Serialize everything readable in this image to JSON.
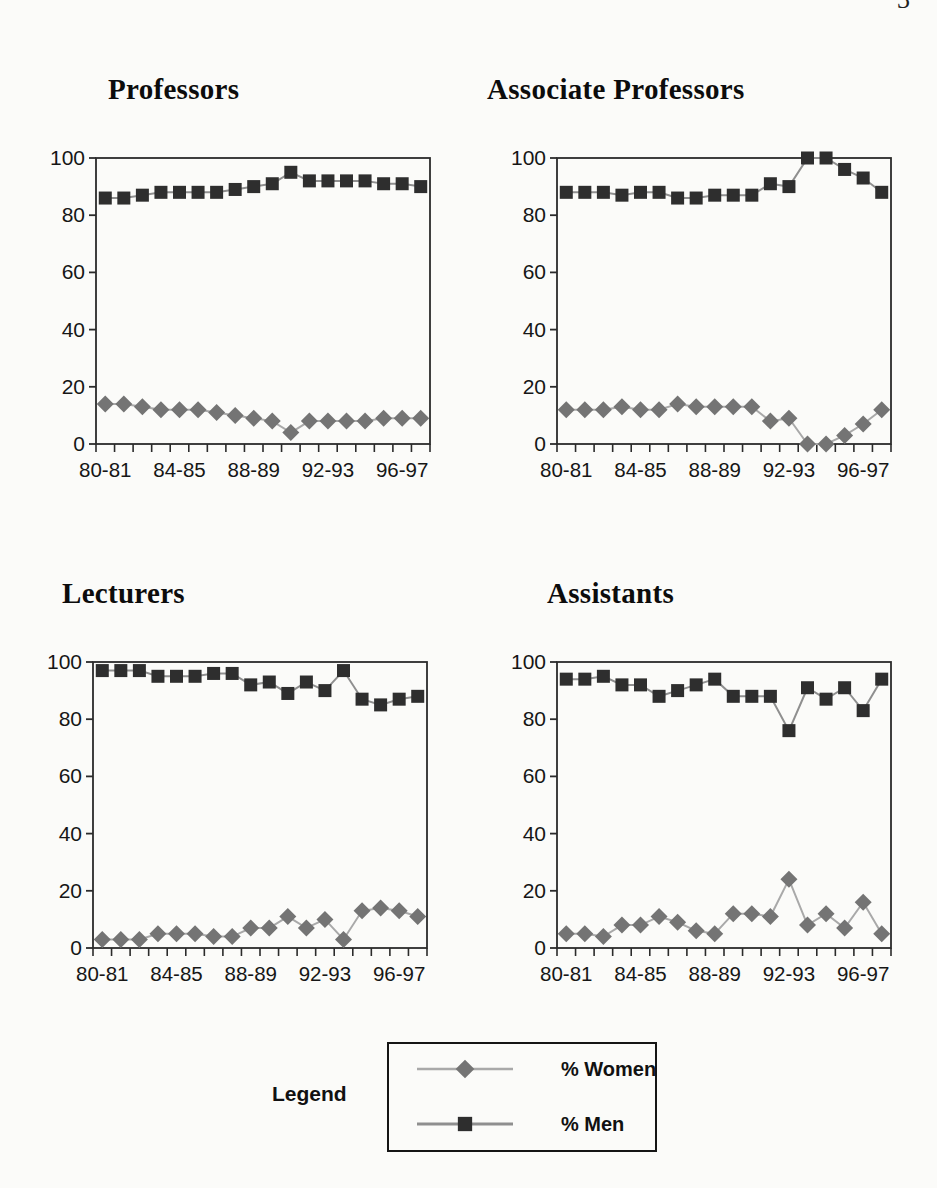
{
  "page": {
    "number_partial": "3"
  },
  "colors": {
    "women_marker": "#747474",
    "women_line": "#a9a9a9",
    "men_marker": "#2e2e2e",
    "men_line": "#8f8f8f",
    "axis": "#2b2b2b",
    "label_text": "#161616"
  },
  "y_axis": {
    "min": 0,
    "max": 100,
    "ticks": [
      0,
      20,
      40,
      60,
      80,
      100
    ]
  },
  "x_axis": {
    "tick_labels": [
      "80-81",
      "84-85",
      "88-89",
      "92-93",
      "96-97"
    ],
    "label_indices": [
      0,
      4,
      8,
      12,
      16
    ]
  },
  "legend": {
    "title": "Legend",
    "items": [
      {
        "label": "% Women",
        "marker": "diamond"
      },
      {
        "label": "% Men",
        "marker": "square"
      }
    ]
  },
  "chart_data": [
    {
      "type": "line",
      "title": "Professors",
      "categories": [
        "80-81",
        "81-82",
        "82-83",
        "83-84",
        "84-85",
        "85-86",
        "86-87",
        "87-88",
        "88-89",
        "89-90",
        "90-91",
        "91-92",
        "92-93",
        "93-94",
        "94-95",
        "95-96",
        "96-97",
        "97-98"
      ],
      "ylim": [
        0,
        100
      ],
      "grid": false,
      "series": [
        {
          "name": "% Women",
          "marker": "diamond",
          "values": [
            14,
            14,
            13,
            12,
            12,
            12,
            11,
            10,
            9,
            8,
            4,
            8,
            8,
            8,
            8,
            9,
            9,
            9
          ]
        },
        {
          "name": "% Men",
          "marker": "square",
          "values": [
            86,
            86,
            87,
            88,
            88,
            88,
            88,
            89,
            90,
            91,
            95,
            92,
            92,
            92,
            92,
            91,
            91,
            90
          ]
        }
      ]
    },
    {
      "type": "line",
      "title": "Associate Professors",
      "categories": [
        "80-81",
        "81-82",
        "82-83",
        "83-84",
        "84-85",
        "85-86",
        "86-87",
        "87-88",
        "88-89",
        "89-90",
        "90-91",
        "91-92",
        "92-93",
        "93-94",
        "94-95",
        "95-96",
        "96-97",
        "97-98"
      ],
      "ylim": [
        0,
        100
      ],
      "grid": false,
      "series": [
        {
          "name": "% Women",
          "marker": "diamond",
          "values": [
            12,
            12,
            12,
            13,
            12,
            12,
            14,
            13,
            13,
            13,
            13,
            8,
            9,
            0,
            0,
            3,
            7,
            12
          ]
        },
        {
          "name": "% Men",
          "marker": "square",
          "values": [
            88,
            88,
            88,
            87,
            88,
            88,
            86,
            86,
            87,
            87,
            87,
            91,
            90,
            100,
            100,
            96,
            93,
            88
          ]
        }
      ]
    },
    {
      "type": "line",
      "title": "Lecturers",
      "categories": [
        "80-81",
        "81-82",
        "82-83",
        "83-84",
        "84-85",
        "85-86",
        "86-87",
        "87-88",
        "88-89",
        "89-90",
        "90-91",
        "91-92",
        "92-93",
        "93-94",
        "94-95",
        "95-96",
        "96-97",
        "97-98"
      ],
      "ylim": [
        0,
        100
      ],
      "grid": false,
      "series": [
        {
          "name": "% Women",
          "marker": "diamond",
          "values": [
            3,
            3,
            3,
            5,
            5,
            5,
            4,
            4,
            7,
            7,
            11,
            7,
            10,
            3,
            13,
            14,
            13,
            11
          ]
        },
        {
          "name": "% Men",
          "marker": "square",
          "values": [
            97,
            97,
            97,
            95,
            95,
            95,
            96,
            96,
            92,
            93,
            89,
            93,
            90,
            97,
            87,
            85,
            87,
            88
          ]
        }
      ]
    },
    {
      "type": "line",
      "title": "Assistants",
      "categories": [
        "80-81",
        "81-82",
        "82-83",
        "83-84",
        "84-85",
        "85-86",
        "86-87",
        "87-88",
        "88-89",
        "89-90",
        "90-91",
        "91-92",
        "92-93",
        "93-94",
        "94-95",
        "95-96",
        "96-97",
        "97-98"
      ],
      "ylim": [
        0,
        100
      ],
      "grid": false,
      "series": [
        {
          "name": "% Women",
          "marker": "diamond",
          "values": [
            5,
            5,
            4,
            8,
            8,
            11,
            9,
            6,
            5,
            12,
            12,
            11,
            24,
            8,
            12,
            7,
            16,
            5
          ]
        },
        {
          "name": "% Men",
          "marker": "square",
          "values": [
            94,
            94,
            95,
            92,
            92,
            88,
            90,
            92,
            94,
            88,
            88,
            88,
            76,
            91,
            87,
            91,
            83,
            94
          ]
        }
      ]
    }
  ]
}
